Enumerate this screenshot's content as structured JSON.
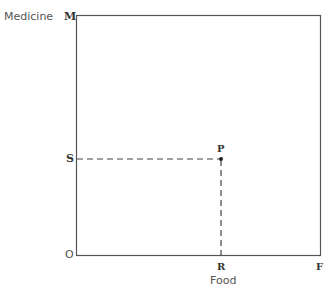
{
  "diagram": {
    "y_axis_label": "Medicine",
    "x_axis_label": "Food",
    "points": {
      "origin": "O",
      "top_left": "M",
      "bottom_right": "F",
      "point": "P",
      "y_projection": "S",
      "x_projection": "R"
    },
    "colors": {
      "line": "#555555",
      "text": "#333333"
    }
  }
}
